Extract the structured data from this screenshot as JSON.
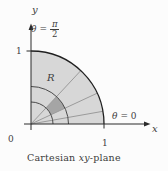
{
  "figure": {
    "caption": {
      "prefix": "Cartesian ",
      "italic_part": "xy",
      "suffix": "-plane"
    },
    "labels": {
      "y_axis": "y",
      "x_axis": "x",
      "region": "R",
      "origin": "0",
      "x_tick_1": "1",
      "y_tick_1": "1",
      "theta_symbol": "θ",
      "theta_half_eq": "=",
      "theta_half_numerator": "π",
      "theta_half_denominator": "2",
      "theta_zero_eq": "= 0"
    },
    "colors": {
      "region_fill": "#d7d7d7",
      "cell_fill": "#a5a5a5",
      "axis_stroke": "#2a2a2a",
      "outer_arc_stroke": "#1f1f1f",
      "inner_arc_stroke": "#4a4a4a",
      "ray_stroke": "#9b9b9b",
      "text": "#3d3d3d"
    }
  }
}
